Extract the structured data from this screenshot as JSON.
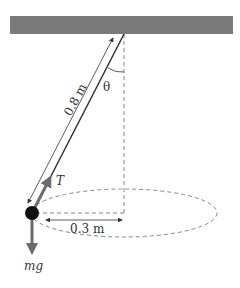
{
  "diagram": {
    "labels": {
      "length": "0.8 m",
      "angle": "θ",
      "tension": "T",
      "radius": "0.3 m",
      "weight": "mg"
    },
    "colors": {
      "ceiling": "#7a7a7a",
      "string": "#333333",
      "bob": "#111111",
      "force_arrow": "#6b6b6b",
      "dashed": "#888888"
    }
  }
}
